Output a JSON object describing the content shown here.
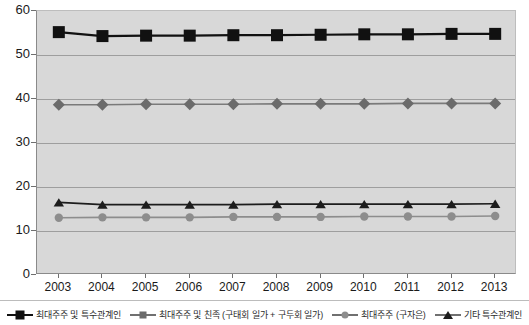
{
  "header": {
    "clipped_text": ""
  },
  "chart_data": {
    "type": "line",
    "title": "",
    "subtitle": "",
    "xlabel": "",
    "ylabel": "",
    "categories": [
      "2003",
      "2004",
      "2005",
      "2006",
      "2007",
      "2008",
      "2009",
      "2010",
      "2011",
      "2012",
      "2013"
    ],
    "ylim": [
      0,
      60
    ],
    "ytick_values": [
      0,
      10,
      20,
      30,
      40,
      50,
      60
    ],
    "ytick_labels": [
      "0",
      "10",
      "20",
      "30",
      "40",
      "50",
      "60"
    ],
    "grid": true,
    "legend_position": "bottom",
    "plot_background": "#d8d8d8",
    "series": [
      {
        "name": "최대주주 및 특수관계인",
        "marker": "square",
        "color": "#111111",
        "line_color": "#111111",
        "values": [
          55.2,
          54.3,
          54.4,
          54.4,
          54.5,
          54.5,
          54.6,
          54.7,
          54.7,
          54.8,
          54.8
        ]
      },
      {
        "name": "최대주주 및 친족 (구태회 일가 + 구두회 일가)",
        "marker": "diamond",
        "color": "#6b6b6b",
        "line_color": "#7a7a7a",
        "values": [
          38.7,
          38.7,
          38.8,
          38.8,
          38.8,
          38.9,
          38.9,
          38.9,
          39.0,
          39.0,
          39.0
        ]
      },
      {
        "name": "최대주주 (구자은)",
        "marker": "circle",
        "color": "#8d8d8d",
        "line_color": "#8d8d8d",
        "values": [
          13.0,
          13.1,
          13.1,
          13.1,
          13.2,
          13.2,
          13.2,
          13.3,
          13.3,
          13.3,
          13.4
        ]
      },
      {
        "name": "기타 특수관계인",
        "marker": "triangle",
        "color": "#1d1d1d",
        "line_color": "#1d1d1d",
        "values": [
          16.5,
          16.0,
          16.0,
          16.0,
          16.0,
          16.1,
          16.1,
          16.1,
          16.1,
          16.1,
          16.2
        ]
      }
    ]
  },
  "legend": {
    "items": [
      {
        "label": "최대주주 및 특수관계인",
        "marker": "square"
      },
      {
        "label": "최대주주 및 친족 (구태회 일가 + 구두회 일가)",
        "marker": "diamond"
      },
      {
        "label": "최대주주 (구자은)",
        "marker": "circle"
      },
      {
        "label": "기타 특수관계인",
        "marker": "triangle"
      }
    ]
  }
}
